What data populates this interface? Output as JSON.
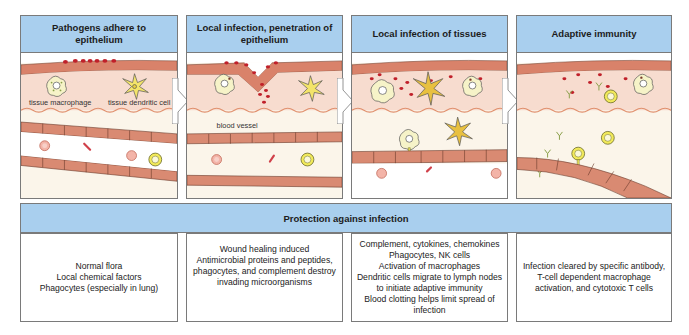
{
  "stages": [
    {
      "title": "Pathogens adhere to epithelium",
      "labels": {
        "macrophage": "tissue macrophage",
        "dendritic": "tissue dendritic cell"
      }
    },
    {
      "title": "Local infection, penetration of epithelium",
      "labels": {
        "vessel": "blood vessel"
      }
    },
    {
      "title": "Local infection of tissues"
    },
    {
      "title": "Adaptive immunity"
    }
  ],
  "protection": {
    "title": "Protection against infection",
    "boxes": [
      {
        "lines": [
          "Normal flora",
          "Local chemical factors",
          "Phagocytes (especially in lung)"
        ]
      },
      {
        "lines": [
          "Wound healing induced",
          "Antimicrobial proteins and peptides,",
          "phagocytes, and complement destroy",
          "invading microorganisms"
        ]
      },
      {
        "lines": [
          "Complement, cytokines, chemokines",
          "Phagocytes, NK cells",
          "Activation of macrophages",
          "Dendritic cells migrate to lymph nodes",
          "to initiate adaptive immunity",
          "Blood clotting helps limit spread of",
          "infection"
        ]
      },
      {
        "lines": [
          "Infection cleared by specific antibody,",
          "T-cell dependent macrophage",
          "activation, and cytotoxic T cells"
        ]
      }
    ]
  },
  "colors": {
    "header_blue": "#a9cfee",
    "epithelium": "#d9826a",
    "tissue": "#f7dccf",
    "pathogen": "#c0202a",
    "endothelium": "#d98a72",
    "lymphocyte": "#f2ea5a"
  }
}
